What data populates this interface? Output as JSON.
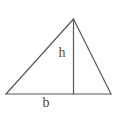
{
  "figure": {
    "name": "triangle-with-base-and-height",
    "background_color": "#ffffff",
    "stroke_color": "#595959",
    "label_color": "#4a4a4a",
    "stroke_width": 1.2,
    "width": 139,
    "height": 118
  },
  "chart_data": {
    "type": "diagram",
    "title": "",
    "subtitle": "",
    "xlabel": "",
    "ylabel": "",
    "grid": false,
    "legend": false,
    "shape": "triangle",
    "vertices": {
      "apex": {
        "x": 73.5,
        "y": 19
      },
      "bottom_left": {
        "x": 6,
        "y": 94
      },
      "bottom_right": {
        "x": 111,
        "y": 94
      }
    },
    "segments": [
      {
        "name": "left-side",
        "from": "bottom_left",
        "to": "apex",
        "x1": 6,
        "y1": 94,
        "x2": 73.5,
        "y2": 19
      },
      {
        "name": "right-side",
        "from": "apex",
        "to": "bottom_right",
        "x1": 73.5,
        "y1": 19,
        "x2": 111,
        "y2": 94
      },
      {
        "name": "base",
        "from": "bottom_left",
        "to": "bottom_right",
        "x1": 6,
        "y1": 94,
        "x2": 111,
        "y2": 94
      },
      {
        "name": "altitude",
        "from": "apex",
        "to": "foot",
        "x1": 73.5,
        "y1": 19,
        "x2": 73.5,
        "y2": 94
      }
    ],
    "annotations": [
      {
        "name": "height-label",
        "text": "h",
        "x": 62,
        "y": 57,
        "anchor": "middle"
      },
      {
        "name": "base-label",
        "text": "b",
        "x": 46,
        "y": 107,
        "anchor": "middle"
      }
    ]
  },
  "labels": {
    "height": "h",
    "base": "b"
  }
}
